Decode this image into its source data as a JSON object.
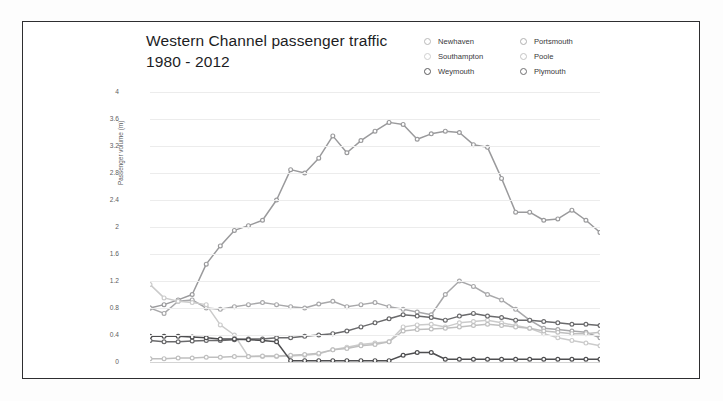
{
  "title": {
    "line1": "Western Channel passenger traffic",
    "line2": "1980 - 2012"
  },
  "legend": {
    "items": [
      {
        "label": "Newhaven",
        "color": "#b9b9b9"
      },
      {
        "label": "Portsmouth",
        "color": "#b0b0b0"
      },
      {
        "label": "Southampton",
        "color": "#cfcfcf"
      },
      {
        "label": "Poole",
        "color": "#c4c4c4"
      },
      {
        "label": "Weymouth",
        "color": "#5a5a5c"
      },
      {
        "label": "Plymouth",
        "color": "#6e6e70"
      }
    ]
  },
  "chart_data": {
    "type": "line",
    "title": "Western Channel passenger traffic 1980 - 2012",
    "xlabel": "",
    "ylabel": "Passenger volume (m)",
    "ylim": [
      0,
      4
    ],
    "yticks": [
      "0",
      "0.4",
      "0.8",
      "1.2",
      "1.6",
      "2",
      "2.4",
      "2.8",
      "3.2",
      "3.6",
      "4"
    ],
    "xlim": [
      1980,
      2012
    ],
    "x": [
      1980,
      1981,
      1982,
      1983,
      1984,
      1985,
      1986,
      1987,
      1988,
      1989,
      1990,
      1991,
      1992,
      1993,
      1994,
      1995,
      1996,
      1997,
      1998,
      1999,
      2000,
      2001,
      2002,
      2003,
      2004,
      2005,
      2006,
      2007,
      2008,
      2009,
      2010,
      2011,
      2012
    ],
    "xticks": [
      "1980",
      "1982",
      "1984",
      "1986",
      "1988",
      "1990",
      "1992",
      "1994",
      "1996",
      "1998",
      "2000",
      "2002",
      "2004",
      "2006",
      "2008",
      "2010",
      "2012"
    ],
    "grid": true,
    "legend_position": "top-right",
    "series": [
      {
        "name": "Portsmouth",
        "color": "#9a9a9c",
        "values": [
          0.8,
          0.85,
          0.92,
          1.0,
          1.45,
          1.72,
          1.95,
          2.02,
          2.1,
          2.4,
          2.85,
          2.8,
          3.02,
          3.35,
          3.1,
          3.28,
          3.42,
          3.55,
          3.52,
          3.3,
          3.38,
          3.42,
          3.4,
          3.22,
          3.18,
          2.72,
          2.22,
          2.22,
          2.1,
          2.12,
          2.25,
          2.1,
          1.92
        ]
      },
      {
        "name": "Newhaven",
        "color": "#a8a8aa",
        "values": [
          0.8,
          0.72,
          0.9,
          0.92,
          0.8,
          0.78,
          0.82,
          0.85,
          0.88,
          0.85,
          0.82,
          0.8,
          0.86,
          0.9,
          0.82,
          0.85,
          0.88,
          0.82,
          0.78,
          0.74,
          0.7,
          1.0,
          1.2,
          1.12,
          1.0,
          0.92,
          0.78,
          0.62,
          0.5,
          0.48,
          0.46,
          0.44,
          0.36
        ]
      },
      {
        "name": "Southampton",
        "color": "#cbcbcb",
        "values": [
          1.15,
          0.95,
          0.9,
          0.88,
          0.85,
          0.55,
          0.4,
          0.08,
          0.08,
          0.08,
          0.09,
          0.1,
          0.12,
          0.18,
          0.22,
          0.26,
          0.28,
          0.3,
          0.52,
          0.55,
          0.56,
          0.52,
          0.58,
          0.6,
          0.62,
          0.58,
          0.54,
          0.5,
          0.42,
          0.36,
          0.32,
          0.28,
          0.24
        ]
      },
      {
        "name": "Poole",
        "color": "#bfbfbf",
        "values": [
          0.05,
          0.05,
          0.06,
          0.06,
          0.07,
          0.07,
          0.08,
          0.08,
          0.09,
          0.09,
          0.1,
          0.11,
          0.13,
          0.18,
          0.2,
          0.24,
          0.26,
          0.3,
          0.46,
          0.48,
          0.49,
          0.5,
          0.52,
          0.54,
          0.56,
          0.54,
          0.52,
          0.5,
          0.46,
          0.44,
          0.42,
          0.42,
          0.44
        ]
      },
      {
        "name": "Plymouth",
        "color": "#6a6a6c",
        "values": [
          0.32,
          0.3,
          0.3,
          0.31,
          0.32,
          0.32,
          0.33,
          0.34,
          0.34,
          0.36,
          0.36,
          0.38,
          0.4,
          0.42,
          0.46,
          0.52,
          0.58,
          0.64,
          0.7,
          0.68,
          0.66,
          0.62,
          0.68,
          0.72,
          0.68,
          0.66,
          0.62,
          0.62,
          0.6,
          0.58,
          0.56,
          0.56,
          0.54
        ]
      },
      {
        "name": "Weymouth",
        "color": "#4e4e50",
        "values": [
          0.38,
          0.38,
          0.38,
          0.37,
          0.36,
          0.34,
          0.34,
          0.33,
          0.32,
          0.3,
          0.02,
          0.02,
          0.02,
          0.02,
          0.02,
          0.02,
          0.02,
          0.02,
          0.1,
          0.14,
          0.14,
          0.04,
          0.04,
          0.04,
          0.04,
          0.04,
          0.04,
          0.04,
          0.04,
          0.04,
          0.04,
          0.04,
          0.04
        ]
      }
    ]
  }
}
